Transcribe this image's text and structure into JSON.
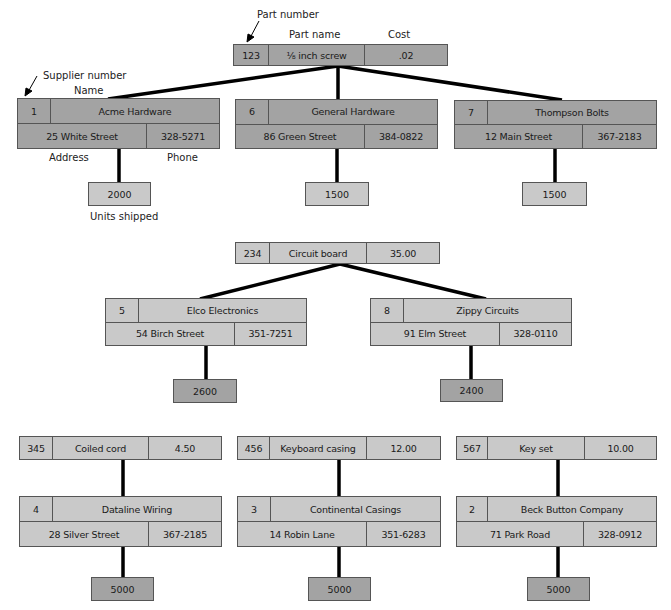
{
  "annotations": {
    "part_number": "Part number",
    "part_name": "Part name",
    "cost": "Cost",
    "supplier_number": "Supplier number",
    "name": "Name",
    "address": "Address",
    "phone": "Phone",
    "units_shipped": "Units shipped"
  },
  "colors": {
    "dark_fill": "#a3a3a3",
    "light_fill": "#c9c9c9",
    "line": "#000000"
  },
  "groups": [
    {
      "part": {
        "number": "123",
        "name": "⅛ inch screw",
        "cost": ".02"
      },
      "suppliers": [
        {
          "number": "1",
          "name": "Acme Hardware",
          "address": "25 White Street",
          "phone": "328-5271",
          "units": "2000"
        },
        {
          "number": "6",
          "name": "General Hardware",
          "address": "86 Green Street",
          "phone": "384-0822",
          "units": "1500"
        },
        {
          "number": "7",
          "name": "Thompson Bolts",
          "address": "12 Main Street",
          "phone": "367-2183",
          "units": "1500"
        }
      ]
    },
    {
      "part": {
        "number": "234",
        "name": "Circuit board",
        "cost": "35.00"
      },
      "suppliers": [
        {
          "number": "5",
          "name": "Elco Electronics",
          "address": "54 Birch Street",
          "phone": "351-7251",
          "units": "2600"
        },
        {
          "number": "8",
          "name": "Zippy Circuits",
          "address": "91 Elm Street",
          "phone": "328-0110",
          "units": "2400"
        }
      ]
    },
    {
      "part": {
        "number": "345",
        "name": "Coiled cord",
        "cost": "4.50"
      },
      "suppliers": [
        {
          "number": "4",
          "name": "Dataline Wiring",
          "address": "28 Silver Street",
          "phone": "367-2185",
          "units": "5000"
        }
      ]
    },
    {
      "part": {
        "number": "456",
        "name": "Keyboard casing",
        "cost": "12.00"
      },
      "suppliers": [
        {
          "number": "3",
          "name": "Continental Casings",
          "address": "14 Robin Lane",
          "phone": "351-6283",
          "units": "5000"
        }
      ]
    },
    {
      "part": {
        "number": "567",
        "name": "Key set",
        "cost": "10.00"
      },
      "suppliers": [
        {
          "number": "2",
          "name": "Beck Button Company",
          "address": "71 Park Road",
          "phone": "328-0912",
          "units": "5000"
        }
      ]
    }
  ]
}
